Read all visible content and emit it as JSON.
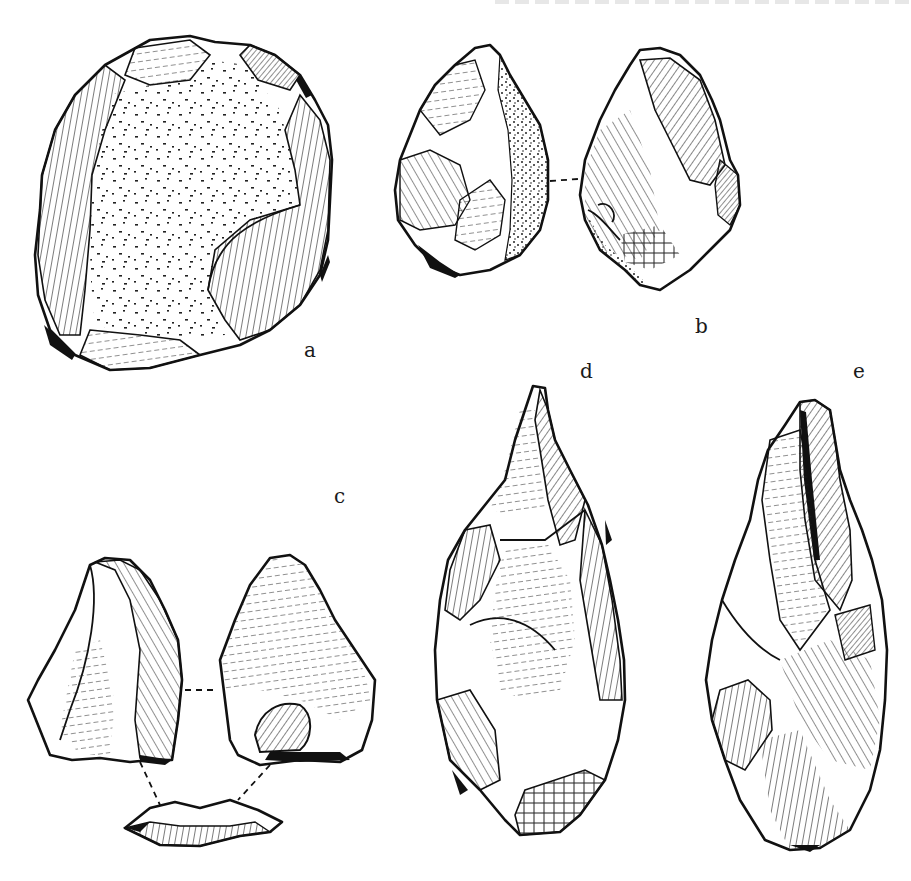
{
  "plate": {
    "header_text": "",
    "figures": [
      {
        "id": "a",
        "label": "a",
        "description": "Ovate core tool with cortex-covered face, flake scars around margins",
        "views": 1
      },
      {
        "id": "b",
        "label": "b",
        "description": "Small pointed handaxe, two faces connected by dashed line",
        "views": 2
      },
      {
        "id": "c",
        "label": "c",
        "description": "Flake shown in three views (two faces and platform) connected by dashed lines",
        "views": 3
      },
      {
        "id": "d",
        "label": "d",
        "description": "Elongated pointed handaxe with faceted butt",
        "views": 1
      },
      {
        "id": "e",
        "label": "e",
        "description": "Elongated handaxe with large longitudinal scar",
        "views": 1
      }
    ]
  },
  "colors": {
    "background": "#ffffff",
    "ink": "#111111"
  }
}
